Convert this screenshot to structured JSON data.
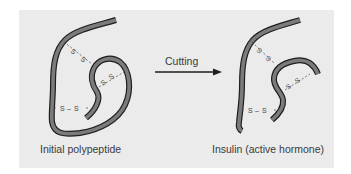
{
  "diagram": {
    "left_label": "Initial polypeptide",
    "right_label": "Insulin (active hormone)",
    "arrow_label": "Cutting",
    "bond_label": "S–S",
    "colors": {
      "background": "#ebebeb",
      "strand_fill": "#7b7b7b",
      "strand_outline": "#1e1e1e",
      "text": "#3a3a3a"
    }
  }
}
